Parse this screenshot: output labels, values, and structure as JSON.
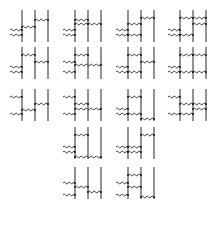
{
  "figure": {
    "colors": {
      "line": "#3a3a3a",
      "wavy": "#2a2a2a",
      "dot": "#1a1a1a",
      "background": "#ffffff"
    }
  },
  "diagrams": [
    {
      "x": 12,
      "y": 8,
      "ext": [
        22,
        27
      ],
      "rungs": [
        [
          0,
          1,
          19
        ],
        [
          1,
          2,
          12
        ]
      ]
    },
    {
      "x": 65,
      "y": 8,
      "ext": [
        22,
        27
      ],
      "rungs": [
        [
          0,
          1,
          12
        ],
        [
          0,
          1,
          16
        ],
        [
          1,
          2,
          16
        ]
      ]
    },
    {
      "x": 118,
      "y": 8,
      "ext": [
        22,
        27
      ],
      "rungs": [
        [
          0,
          1,
          16
        ],
        [
          1,
          2,
          10
        ],
        [
          0,
          1,
          27
        ]
      ]
    },
    {
      "x": 170,
      "y": 8,
      "ext": [
        22,
        27
      ],
      "rungs": [
        [
          0,
          1,
          10
        ],
        [
          1,
          2,
          10
        ],
        [
          0,
          1,
          27
        ],
        [
          1,
          2,
          16
        ]
      ]
    },
    {
      "x": 12,
      "y": 45,
      "ext": [
        22,
        27
      ],
      "rungs": [
        [
          0,
          1,
          10
        ],
        [
          1,
          2,
          17
        ]
      ]
    },
    {
      "x": 65,
      "y": 45,
      "ext": [
        17,
        27
      ],
      "rungs": [
        [
          0,
          1,
          10
        ],
        [
          0,
          2,
          20
        ]
      ]
    },
    {
      "x": 118,
      "y": 45,
      "ext": [
        22,
        27
      ],
      "rungs": [
        [
          0,
          1,
          10
        ],
        [
          1,
          2,
          17
        ],
        [
          0,
          1,
          27
        ]
      ]
    },
    {
      "x": 170,
      "y": 45,
      "ext": [
        22,
        27
      ],
      "rungs": [
        [
          0,
          1,
          10
        ],
        [
          1,
          2,
          10
        ],
        [
          0,
          1,
          27
        ],
        [
          1,
          2,
          27
        ]
      ]
    },
    {
      "x": 12,
      "y": 87,
      "ext": [
        10,
        27
      ],
      "rungs": [
        [
          0,
          1,
          23
        ],
        [
          1,
          2,
          17
        ]
      ]
    },
    {
      "x": 65,
      "y": 87,
      "ext": [
        10,
        27
      ],
      "rungs": [
        [
          0,
          1,
          17
        ],
        [
          0,
          2,
          22
        ]
      ]
    },
    {
      "x": 118,
      "y": 87,
      "ext": [
        22,
        27
      ],
      "rungs": [
        [
          0,
          1,
          10
        ],
        [
          0,
          1,
          27
        ],
        [
          1,
          2,
          32
        ]
      ]
    },
    {
      "x": 170,
      "y": 87,
      "ext": [
        10,
        27
      ],
      "rungs": [
        [
          0,
          1,
          17
        ],
        [
          1,
          2,
          17
        ],
        [
          1,
          2,
          22
        ],
        [
          0,
          1,
          27
        ]
      ]
    },
    {
      "x": 65,
      "y": 125,
      "ext": [
        22,
        27
      ],
      "rungs": [
        [
          0,
          1,
          10
        ],
        [
          0,
          2,
          32
        ]
      ]
    },
    {
      "x": 118,
      "y": 125,
      "ext": [
        22,
        27
      ],
      "rungs": [
        [
          1,
          2,
          10
        ],
        [
          0,
          1,
          22
        ],
        [
          0,
          1,
          27
        ]
      ]
    },
    {
      "x": 65,
      "y": 165,
      "ext": [
        18,
        30
      ],
      "rungs": [
        [
          0,
          1,
          22
        ],
        [
          1,
          2,
          27
        ]
      ]
    },
    {
      "x": 118,
      "y": 165,
      "ext": [
        18,
        30
      ],
      "rungs": [
        [
          0,
          1,
          10
        ],
        [
          0,
          1,
          22
        ],
        [
          1,
          2,
          32
        ]
      ]
    }
  ]
}
